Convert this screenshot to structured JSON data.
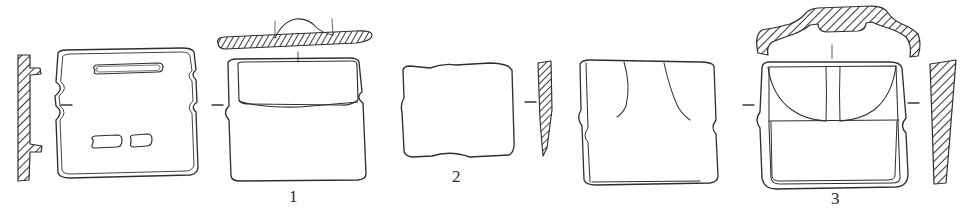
{
  "plate": {
    "kind": "archaeological-illustration-plate",
    "background_color": "#ffffff",
    "ink_color": "#2f2f2f",
    "hatch_color": "#3a3a3a",
    "width": 966,
    "height": 224,
    "figure_labels": [
      {
        "id": "figure-1",
        "text": "1",
        "x": 289,
        "y": 188
      },
      {
        "id": "figure-2",
        "text": "2",
        "x": 452,
        "y": 168
      },
      {
        "id": "figure-3",
        "text": "3",
        "x": 831,
        "y": 190
      }
    ],
    "figures": [
      {
        "number": "1",
        "label": "1",
        "views": [
          {
            "name": "section-profile-left",
            "type": "hatched-section",
            "description": "vertical hatched wall section with two lug protrusions on the right side",
            "hatched": true
          },
          {
            "name": "plan-view",
            "type": "outline-drawing",
            "description": "rectangular slab in plan with one long horizontal slot near top and two short slots near bottom",
            "hatched": false,
            "features": [
              "long-slot",
              "short-slot-left",
              "short-slot-right"
            ]
          },
          {
            "name": "rim-profile-top",
            "type": "hatched-section",
            "description": "flat horizontal hatched bar with low central boss and two tick marks",
            "hatched": true
          },
          {
            "name": "front-elevation",
            "type": "outline-drawing",
            "description": "rectangular body with inset panel across the upper register",
            "hatched": false,
            "features": [
              "upper-panel"
            ]
          }
        ],
        "tick_marks": 2
      },
      {
        "number": "2",
        "label": "2",
        "views": [
          {
            "name": "front-elevation",
            "type": "outline-drawing",
            "description": "plain rectangular slab with irregular freehand edges",
            "hatched": false,
            "features": []
          },
          {
            "name": "section-profile-right",
            "type": "hatched-section",
            "description": "narrow hatched profile tapering to a point at the bottom",
            "hatched": true
          }
        ],
        "tick_marks": 0
      },
      {
        "number": "3",
        "label": "3",
        "views": [
          {
            "name": "side-elevation",
            "type": "outline-drawing",
            "description": "rectangular body with two curved incised lines hanging from the top edge",
            "hatched": false,
            "features": [
              "incised-line-left",
              "incised-line-right"
            ]
          },
          {
            "name": "rim-profile-top",
            "type": "hatched-section",
            "description": "arched hatched rim profile with raised central band and downturned ends",
            "hatched": true
          },
          {
            "name": "front-elevation",
            "type": "outline-drawing",
            "description": "rounded-rectangular body with two arcs forming a central arch and a horizontal register line",
            "hatched": false,
            "features": [
              "arch-left",
              "arch-right",
              "register-line",
              "inner-frame"
            ]
          },
          {
            "name": "section-profile-right",
            "type": "hatched-section",
            "description": "broad hatched wall profile tapering downward",
            "hatched": true
          }
        ],
        "tick_marks": 1
      }
    ],
    "connector_dashes": [
      {
        "id": "dash-1",
        "x": 66,
        "y": 105
      },
      {
        "id": "dash-2",
        "x": 217,
        "y": 105
      },
      {
        "id": "dash-3",
        "x": 530,
        "y": 102
      },
      {
        "id": "dash-4",
        "x": 748,
        "y": 105
      },
      {
        "id": "dash-5",
        "x": 913,
        "y": 103
      }
    ]
  }
}
